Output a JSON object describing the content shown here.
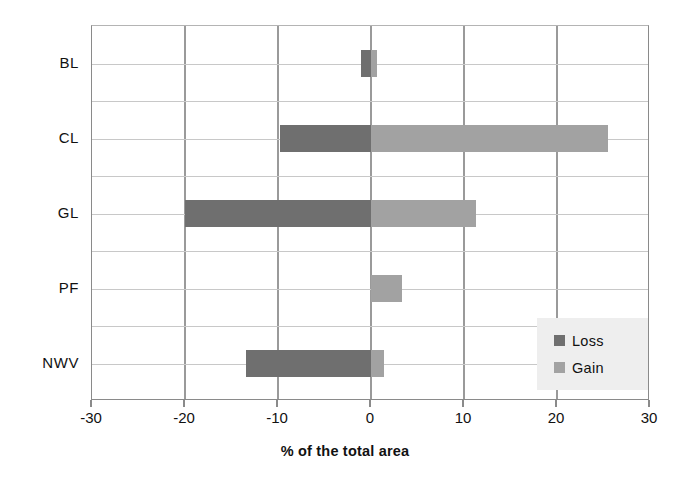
{
  "chart_data": {
    "type": "bar",
    "orientation": "horizontal",
    "title": "",
    "subtitle": "",
    "xlabel": "% of the total area",
    "ylabel": "",
    "xlim": [
      -30,
      30
    ],
    "xticks": [
      -30,
      -20,
      -10,
      0,
      10,
      20,
      30
    ],
    "xticklabels": [
      "-30",
      "-20",
      "-10",
      "0",
      "10",
      "20",
      "30"
    ],
    "categories": [
      "BL",
      "CL",
      "GL",
      "PF",
      "NWV"
    ],
    "grid": "both",
    "legend_position": "lower right",
    "series": [
      {
        "name": "Loss",
        "color": "#6f6f6f",
        "values": [
          -1.1,
          -9.8,
          -20.0,
          0.0,
          -13.4
        ]
      },
      {
        "name": "Gain",
        "color": "#a2a2a2",
        "values": [
          0.6,
          25.5,
          11.3,
          3.3,
          1.4
        ]
      }
    ],
    "annotations": []
  },
  "axis": {
    "x_title": "% of the total area",
    "tick_labels": [
      "-30",
      "-20",
      "-10",
      "0",
      "10",
      "20",
      "30"
    ],
    "category_labels": [
      "BL",
      "CL",
      "GL",
      "PF",
      "NWV"
    ]
  },
  "legend": {
    "items": [
      {
        "label": "Loss",
        "color": "#6f6f6f"
      },
      {
        "label": "Gain",
        "color": "#a2a2a2"
      }
    ]
  },
  "colors": {
    "loss": "#6f6f6f",
    "gain": "#a2a2a2",
    "grid_major": "#9a9a9a",
    "grid_minor": "#c8c8c8",
    "axis": "#8a8a8a",
    "legend_background": "#eeeeee",
    "plot_background": "#ffffff"
  }
}
